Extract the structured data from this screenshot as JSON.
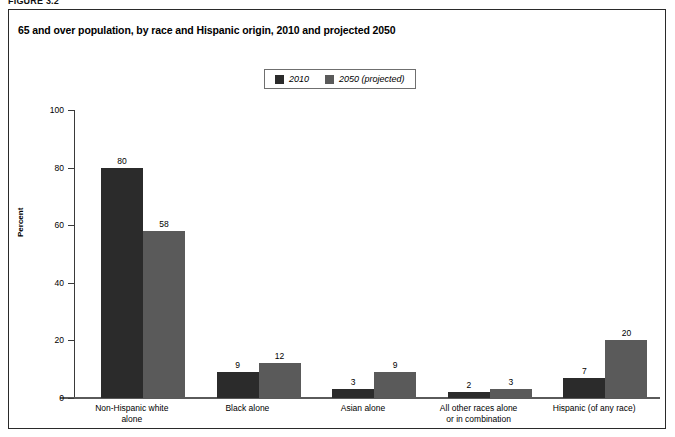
{
  "figure_number": "FIGURE 3.2",
  "chart_title": "65 and over population, by race and Hispanic origin, 2010 and projected 2050",
  "y_axis_title": "Percent",
  "legend": {
    "items": [
      {
        "label": "2010",
        "color": "#2b2b2b"
      },
      {
        "label": "2050 (projected)",
        "color": "#5a5a5a"
      }
    ]
  },
  "y_ticks": [
    "0",
    "20",
    "40",
    "60",
    "80",
    "100"
  ],
  "chart_data": {
    "type": "bar",
    "title": "65 and over population, by race and Hispanic origin, 2010 and projected 2050",
    "xlabel": "",
    "ylabel": "Percent",
    "ylim": [
      0,
      100
    ],
    "yticks": [
      0,
      20,
      40,
      60,
      80,
      100
    ],
    "grid": false,
    "legend_position": "top-center",
    "categories": [
      "Non-Hispanic white\nalone",
      "Black alone",
      "Asian alone",
      "All other races alone\nor in combination",
      "Hispanic (of any race)"
    ],
    "series": [
      {
        "name": "2010",
        "color": "#2b2b2b",
        "values": [
          80,
          9,
          3,
          2,
          7
        ]
      },
      {
        "name": "2050 (projected)",
        "color": "#5a5a5a",
        "values": [
          58,
          12,
          9,
          3,
          20
        ]
      }
    ]
  }
}
